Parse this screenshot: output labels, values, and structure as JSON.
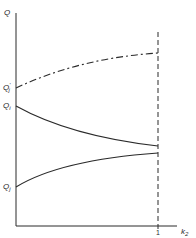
{
  "diagram": {
    "y_axis": {
      "label": "Q"
    },
    "x_axis": {
      "label": "k",
      "label_sub": "2",
      "tick_label": "1"
    },
    "curves": [
      {
        "name": "Q'_j",
        "label": "Q",
        "label_sub": "j",
        "prime": "'",
        "style": "dash-dot",
        "start_y_label": "Q'j",
        "trend": "increasing"
      },
      {
        "name": "Q_i",
        "label": "Q",
        "label_sub": "i",
        "style": "solid",
        "trend": "decreasing"
      },
      {
        "name": "Q_j",
        "label": "Q",
        "label_sub": "j",
        "style": "solid",
        "trend": "increasing"
      }
    ],
    "vertical_marker": {
      "at_x": "1",
      "style": "dashed"
    },
    "colors": {
      "line": "#2a2a2a",
      "background": "#ffffff"
    }
  }
}
